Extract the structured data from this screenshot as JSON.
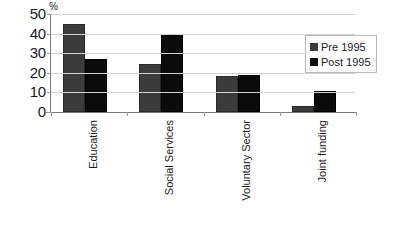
{
  "chart_data": {
    "type": "bar",
    "title": "",
    "subtitle": "",
    "xlabel": "",
    "ylabel": "%",
    "ylim": [
      0,
      50
    ],
    "yticks": [
      0,
      10,
      20,
      30,
      40,
      50
    ],
    "grid": true,
    "legend_position": "top-right",
    "categories": [
      "Education",
      "Social Services",
      "Voluntary Sector",
      "Joint funding"
    ],
    "series": [
      {
        "name": "Pre 1995",
        "color": "#3b3b3b",
        "values": [
          45,
          24.5,
          18.5,
          3
        ]
      },
      {
        "name": "Post 1995",
        "color": "#0b0b0b",
        "values": [
          27,
          39.5,
          19,
          10.5
        ]
      }
    ]
  },
  "axis": {
    "percent_symbol": "%",
    "tick_labels": [
      "50",
      "40",
      "30",
      "20",
      "10",
      "0"
    ]
  },
  "legend": {
    "entries": [
      {
        "label": "Pre 1995",
        "swatch": "pre"
      },
      {
        "label": "Post 1995",
        "swatch": "post"
      }
    ]
  }
}
